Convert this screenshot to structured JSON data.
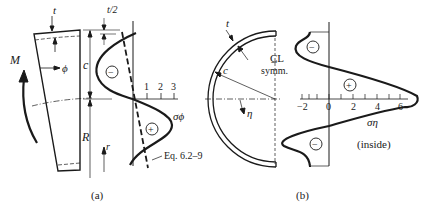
{
  "panel_a": {
    "caption": "(a)",
    "labels": {
      "t": "t",
      "t_half": "t/2",
      "c": "c",
      "R": "R",
      "r": "r",
      "M": "M",
      "phi": "ϕ",
      "sigma_phi": "σϕ",
      "equation": "Eq. 6.2–9",
      "minus": "−",
      "plus": "+"
    },
    "axis_ticks": [
      "1",
      "2",
      "3"
    ]
  },
  "panel_b": {
    "caption": "(b)",
    "labels": {
      "t": "t",
      "c": "c",
      "centerline": "C̲L",
      "symm": "symm.",
      "eta": "η",
      "sigma_eta": "ση",
      "inside": "(inside)",
      "minus_top": "−",
      "plus": "+",
      "minus_bottom": "−"
    },
    "axis_ticks": [
      "−2",
      "0",
      "2",
      "4",
      "6"
    ]
  },
  "colors": {
    "ink": "#1a1a1a",
    "background": "#ffffff"
  }
}
